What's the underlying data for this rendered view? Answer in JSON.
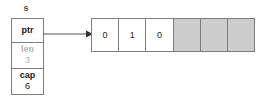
{
  "diagram": {
    "variable_label": "s",
    "struct": {
      "fields": [
        {
          "key": "ptr",
          "value": "",
          "dimmed": false
        },
        {
          "key": "len",
          "value": "3",
          "dimmed": true
        },
        {
          "key": "cap",
          "value": "6",
          "dimmed": false
        }
      ]
    },
    "pointer_arrow": {
      "name": "ptr-to-buffer-arrow"
    },
    "buffer": {
      "cells": [
        {
          "value": "0",
          "state": "used"
        },
        {
          "value": "1",
          "state": "used"
        },
        {
          "value": "0",
          "state": "used"
        },
        {
          "value": "",
          "state": "spare"
        },
        {
          "value": "",
          "state": "spare"
        },
        {
          "value": "",
          "state": "spare"
        }
      ]
    },
    "colors": {
      "border": "#7d7d7d",
      "text": "#1a1a1a",
      "dimmed_text": "#b4b4b4",
      "spare_fill": "#cccccc",
      "background": "#ffffff"
    }
  }
}
